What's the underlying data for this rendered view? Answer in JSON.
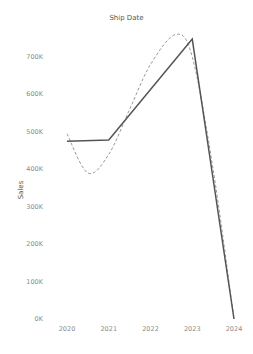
{
  "chart_data": {
    "type": "line",
    "title": "Ship Date",
    "xlabel": "",
    "ylabel": "Sales",
    "categories": [
      "2020",
      "2021",
      "2022",
      "2023",
      "2024"
    ],
    "series": [
      {
        "name": "Sales",
        "style": "solid",
        "color": "#555555",
        "values": [
          475000,
          478000,
          613000,
          748000,
          0
        ]
      },
      {
        "name": "Trend line",
        "style": "dashed",
        "color": "#999999",
        "values": [
          495000,
          400000,
          640000,
          730000,
          0
        ]
      }
    ],
    "yticks": [
      "0K",
      "100K",
      "200K",
      "300K",
      "400K",
      "500K",
      "600K",
      "700K"
    ],
    "ylim": [
      0,
      760000
    ],
    "grid": false,
    "legend": "none"
  }
}
